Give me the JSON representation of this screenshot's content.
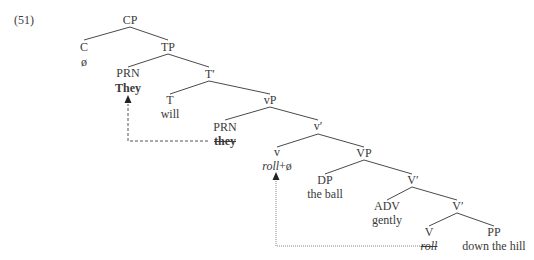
{
  "example_number": "(51)",
  "nodes": {
    "cp": {
      "label": "CP"
    },
    "c": {
      "label": "C",
      "word": "ø"
    },
    "tp": {
      "label": "TP"
    },
    "prn_spec_tp": {
      "label": "PRN",
      "word": "They"
    },
    "t_bar": {
      "label": "T′"
    },
    "t": {
      "label": "T",
      "word": "will"
    },
    "vp_light": {
      "label": "vP"
    },
    "prn_spec_vp": {
      "label": "PRN",
      "word": "they"
    },
    "v_light_bar": {
      "label": "v′"
    },
    "v_light": {
      "label": "v",
      "word": "roll",
      "word_suffix": "+ø"
    },
    "vp": {
      "label": "VP"
    },
    "dp": {
      "label": "DP",
      "word": "the ball"
    },
    "v_bar_1": {
      "label": "V′"
    },
    "adv": {
      "label": "ADV",
      "word": "gently"
    },
    "v_bar_2": {
      "label": "V′"
    },
    "v": {
      "label": "V",
      "word": "roll"
    },
    "pp": {
      "label": "PP",
      "word": "down the hill"
    }
  },
  "movements": [
    {
      "from": "they",
      "to": "They",
      "style": "dashed"
    },
    {
      "from": "roll",
      "to": "roll+ø",
      "style": "dotted"
    }
  ],
  "colors": {
    "line": "#444444",
    "text": "#3a3a3a",
    "background": "#ffffff"
  }
}
